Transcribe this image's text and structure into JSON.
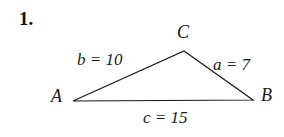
{
  "figure": {
    "problem_number": "1.",
    "type": "triangle-diagram",
    "line_color": "#1a1a1a",
    "text_color": "#1a1a1a",
    "background_color": "#ffffff",
    "vertices": [
      {
        "name": "A",
        "label": "A",
        "x": 73,
        "y": 101
      },
      {
        "name": "B",
        "label": "B",
        "x": 253,
        "y": 100
      },
      {
        "name": "C",
        "label": "C",
        "x": 184,
        "y": 51
      }
    ],
    "sides": [
      {
        "name": "a",
        "label": "a = 7",
        "value": 7,
        "opposite_vertex": "A",
        "between": [
          "C",
          "B"
        ]
      },
      {
        "name": "b",
        "label": "b = 10",
        "value": 10,
        "opposite_vertex": "B",
        "between": [
          "A",
          "C"
        ]
      },
      {
        "name": "c",
        "label": "c = 15",
        "value": 15,
        "opposite_vertex": "C",
        "between": [
          "A",
          "B"
        ]
      }
    ]
  }
}
